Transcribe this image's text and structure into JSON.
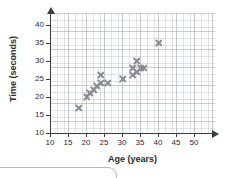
{
  "chart_data": {
    "type": "scatter",
    "title": "",
    "xlabel": "Age (years)",
    "ylabel": "Time (seconds)",
    "xlim": [
      10,
      55
    ],
    "ylim": [
      10,
      43
    ],
    "xticks": [
      10,
      15,
      20,
      25,
      30,
      35,
      40,
      45,
      50
    ],
    "yticks": [
      10,
      15,
      20,
      25,
      30,
      35,
      40
    ],
    "xtick_labels": [
      "10",
      "15",
      "20",
      "25",
      "30",
      "35",
      "40",
      "45",
      "50"
    ],
    "ytick_labels": [
      "10",
      "15",
      "20",
      "25",
      "30",
      "35",
      "40"
    ],
    "grid": true,
    "legend": "none",
    "marker": "x",
    "marker_color": "#8a8a94",
    "points": [
      {
        "x": 18,
        "y": 17
      },
      {
        "x": 20,
        "y": 20
      },
      {
        "x": 21,
        "y": 21
      },
      {
        "x": 22,
        "y": 22
      },
      {
        "x": 23,
        "y": 23
      },
      {
        "x": 24,
        "y": 26
      },
      {
        "x": 24,
        "y": 24
      },
      {
        "x": 26,
        "y": 24
      },
      {
        "x": 30,
        "y": 25
      },
      {
        "x": 33,
        "y": 28
      },
      {
        "x": 33,
        "y": 26
      },
      {
        "x": 34,
        "y": 30
      },
      {
        "x": 34,
        "y": 27
      },
      {
        "x": 35,
        "y": 28
      },
      {
        "x": 36,
        "y": 28
      },
      {
        "x": 40,
        "y": 35
      }
    ]
  },
  "axes": {
    "x_title": "Age (years)",
    "y_title": "Time (seconds)"
  }
}
